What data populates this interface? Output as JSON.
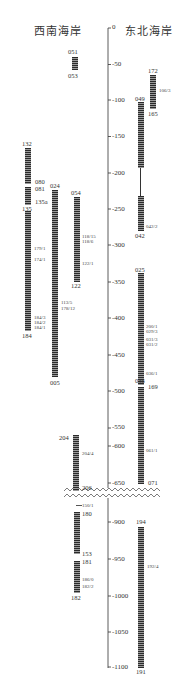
{
  "titles": {
    "left": "西南海岸",
    "right": "东北海岸"
  },
  "axis": {
    "ticks_upper": [
      "0",
      "-50",
      "-100",
      "-150",
      "-200",
      "-250",
      "-300",
      "-350",
      "-400",
      "-450",
      "-500",
      "-550",
      "-600",
      "-650"
    ],
    "ticks_lower": [
      "-900",
      "-950",
      "-1000",
      "-1050",
      "-1100"
    ],
    "break_between": [
      "-650",
      "-900"
    ]
  },
  "cores_left": [
    {
      "top": "051",
      "bottom": "053",
      "samples": []
    },
    {
      "top": "132",
      "bottom": "184",
      "mid_labels": [
        "080",
        "081",
        "135a",
        "135"
      ],
      "samples": [
        "179/1",
        "174/1",
        "184/3",
        "184/2",
        "184/1"
      ]
    },
    {
      "top": "024",
      "bottom": "005",
      "samples": [
        "113/5",
        "178/12"
      ]
    },
    {
      "top": "054",
      "bottom": "122",
      "samples": [
        "118/15",
        "118/6",
        "122/1"
      ]
    },
    {
      "top": "204",
      "bottom": "206",
      "samples": [
        "204/4"
      ]
    },
    {
      "top": "180",
      "bottom": "153",
      "samples": [
        "150/1"
      ]
    },
    {
      "top": "181",
      "bottom": "182",
      "samples": [
        "186/0",
        "182/2"
      ]
    }
  ],
  "cores_right": [
    {
      "top": "049",
      "bottom": "042",
      "samples": [
        "042/2"
      ]
    },
    {
      "top": "172",
      "bottom": "165",
      "samples": [
        "106/3"
      ]
    },
    {
      "top": "025",
      "bottom": "036",
      "samples": [
        "200/1",
        "029/3",
        "031/3",
        "031/2",
        "036/1"
      ]
    },
    {
      "top": "169",
      "bottom": "071",
      "samples": [
        "061/1"
      ]
    },
    {
      "top": "194",
      "bottom": "191",
      "samples": [
        "192/4"
      ]
    }
  ],
  "colors": {
    "axis": "#333333",
    "core_dark": "#2a2a2a",
    "core_light": "#9a9a9a",
    "text": "#333333"
  }
}
